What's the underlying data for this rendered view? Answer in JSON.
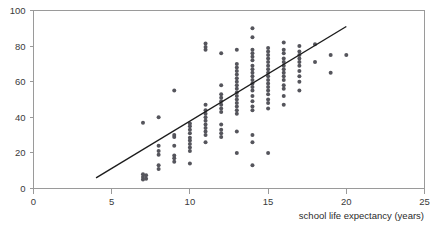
{
  "chart_data": {
    "type": "scatter",
    "title": "",
    "subtitle": "",
    "xlabel": "school life expectancy (years)",
    "ylabel": "",
    "xlim": [
      0,
      25
    ],
    "ylim": [
      0,
      100
    ],
    "xticks": [
      0,
      5,
      10,
      15,
      20,
      25
    ],
    "yticks": [
      0,
      20,
      40,
      60,
      80,
      100
    ],
    "xtick_labels": [
      "0",
      "5",
      "10",
      "15",
      "20",
      "25"
    ],
    "ytick_labels": [
      "0",
      "20",
      "40",
      "60",
      "80",
      "100"
    ],
    "grid": false,
    "legend": null,
    "legend_position": "none",
    "marker": {
      "shape": "circle",
      "color": "#55555c",
      "size": 2.0
    },
    "annotations": [],
    "series": [
      {
        "name": "countries",
        "type": "scatter",
        "points": [
          [
            7.0,
            5.0
          ],
          [
            7.0,
            6.5
          ],
          [
            7.0,
            8.0
          ],
          [
            7.0,
            37.0
          ],
          [
            7.2,
            5.5
          ],
          [
            7.2,
            7.5
          ],
          [
            8.0,
            11.0
          ],
          [
            8.0,
            13.0
          ],
          [
            8.0,
            19.0
          ],
          [
            8.0,
            21.0
          ],
          [
            8.0,
            24.0
          ],
          [
            8.0,
            40.0
          ],
          [
            9.0,
            15.0
          ],
          [
            9.0,
            17.0
          ],
          [
            9.0,
            18.5
          ],
          [
            9.0,
            24.0
          ],
          [
            9.0,
            29.0
          ],
          [
            9.0,
            30.0
          ],
          [
            9.0,
            55.0
          ],
          [
            10.0,
            14.0
          ],
          [
            10.0,
            21.0
          ],
          [
            10.0,
            23.0
          ],
          [
            10.0,
            25.0
          ],
          [
            10.0,
            27.0
          ],
          [
            10.0,
            28.5
          ],
          [
            10.0,
            31.0
          ],
          [
            10.0,
            33.0
          ],
          [
            10.0,
            35.0
          ],
          [
            10.0,
            36.5
          ],
          [
            11.0,
            26.0
          ],
          [
            11.0,
            30.0
          ],
          [
            11.0,
            32.0
          ],
          [
            11.0,
            34.0
          ],
          [
            11.0,
            36.0
          ],
          [
            11.0,
            38.0
          ],
          [
            11.0,
            40.0
          ],
          [
            11.0,
            42.0
          ],
          [
            11.0,
            44.0
          ],
          [
            11.0,
            47.0
          ],
          [
            11.0,
            78.0
          ],
          [
            11.0,
            79.5
          ],
          [
            11.0,
            81.5
          ],
          [
            12.0,
            29.0
          ],
          [
            12.0,
            31.0
          ],
          [
            12.0,
            33.0
          ],
          [
            12.0,
            36.0
          ],
          [
            12.0,
            43.0
          ],
          [
            12.0,
            45.0
          ],
          [
            12.0,
            47.0
          ],
          [
            12.0,
            49.0
          ],
          [
            12.0,
            51.0
          ],
          [
            12.0,
            53.0
          ],
          [
            12.0,
            58.0
          ],
          [
            12.0,
            76.0
          ],
          [
            13.0,
            20.0
          ],
          [
            13.0,
            32.0
          ],
          [
            13.0,
            42.0
          ],
          [
            13.0,
            44.0
          ],
          [
            13.0,
            46.0
          ],
          [
            13.0,
            48.0
          ],
          [
            13.0,
            50.0
          ],
          [
            13.0,
            52.0
          ],
          [
            13.0,
            54.0
          ],
          [
            13.0,
            56.0
          ],
          [
            13.0,
            58.0
          ],
          [
            13.0,
            60.0
          ],
          [
            13.0,
            62.0
          ],
          [
            13.0,
            64.0
          ],
          [
            13.0,
            66.0
          ],
          [
            13.0,
            68.0
          ],
          [
            13.0,
            70.0
          ],
          [
            13.0,
            78.0
          ],
          [
            14.0,
            13.0
          ],
          [
            14.0,
            26.0
          ],
          [
            14.0,
            30.0
          ],
          [
            14.0,
            44.0
          ],
          [
            14.0,
            46.0
          ],
          [
            14.0,
            49.0
          ],
          [
            14.0,
            52.0
          ],
          [
            14.0,
            55.0
          ],
          [
            14.0,
            57.0
          ],
          [
            14.0,
            59.0
          ],
          [
            14.0,
            61.0
          ],
          [
            14.0,
            63.0
          ],
          [
            14.0,
            65.0
          ],
          [
            14.0,
            67.0
          ],
          [
            14.0,
            69.0
          ],
          [
            14.0,
            72.0
          ],
          [
            14.0,
            74.0
          ],
          [
            14.0,
            76.0
          ],
          [
            14.0,
            78.0
          ],
          [
            14.0,
            85.0
          ],
          [
            14.0,
            90.0
          ],
          [
            15.0,
            20.0
          ],
          [
            15.0,
            45.0
          ],
          [
            15.0,
            48.0
          ],
          [
            15.0,
            50.0
          ],
          [
            15.0,
            53.0
          ],
          [
            15.0,
            55.0
          ],
          [
            15.0,
            57.0
          ],
          [
            15.0,
            59.0
          ],
          [
            15.0,
            61.0
          ],
          [
            15.0,
            63.0
          ],
          [
            15.0,
            65.0
          ],
          [
            15.0,
            67.0
          ],
          [
            15.0,
            69.0
          ],
          [
            15.0,
            71.0
          ],
          [
            15.0,
            73.0
          ],
          [
            15.0,
            75.0
          ],
          [
            15.0,
            77.0
          ],
          [
            15.0,
            79.0
          ],
          [
            16.0,
            47.0
          ],
          [
            16.0,
            52.0
          ],
          [
            16.0,
            56.0
          ],
          [
            16.0,
            58.0
          ],
          [
            16.0,
            61.0
          ],
          [
            16.0,
            63.0
          ],
          [
            16.0,
            65.0
          ],
          [
            16.0,
            67.0
          ],
          [
            16.0,
            69.0
          ],
          [
            16.0,
            71.0
          ],
          [
            16.0,
            73.0
          ],
          [
            16.0,
            76.0
          ],
          [
            16.0,
            78.0
          ],
          [
            16.0,
            82.0
          ],
          [
            17.0,
            55.0
          ],
          [
            17.0,
            60.0
          ],
          [
            17.0,
            63.0
          ],
          [
            17.0,
            66.0
          ],
          [
            17.0,
            69.0
          ],
          [
            17.0,
            71.0
          ],
          [
            17.0,
            73.0
          ],
          [
            17.0,
            75.0
          ],
          [
            17.0,
            77.0
          ],
          [
            17.0,
            80.0
          ],
          [
            18.0,
            71.0
          ],
          [
            18.0,
            81.0
          ],
          [
            19.0,
            65.0
          ],
          [
            19.0,
            75.0
          ],
          [
            20.0,
            75.0
          ]
        ]
      },
      {
        "name": "trend line",
        "type": "line",
        "points": [
          [
            4.0,
            6.0
          ],
          [
            20.0,
            91.0
          ]
        ]
      }
    ]
  }
}
